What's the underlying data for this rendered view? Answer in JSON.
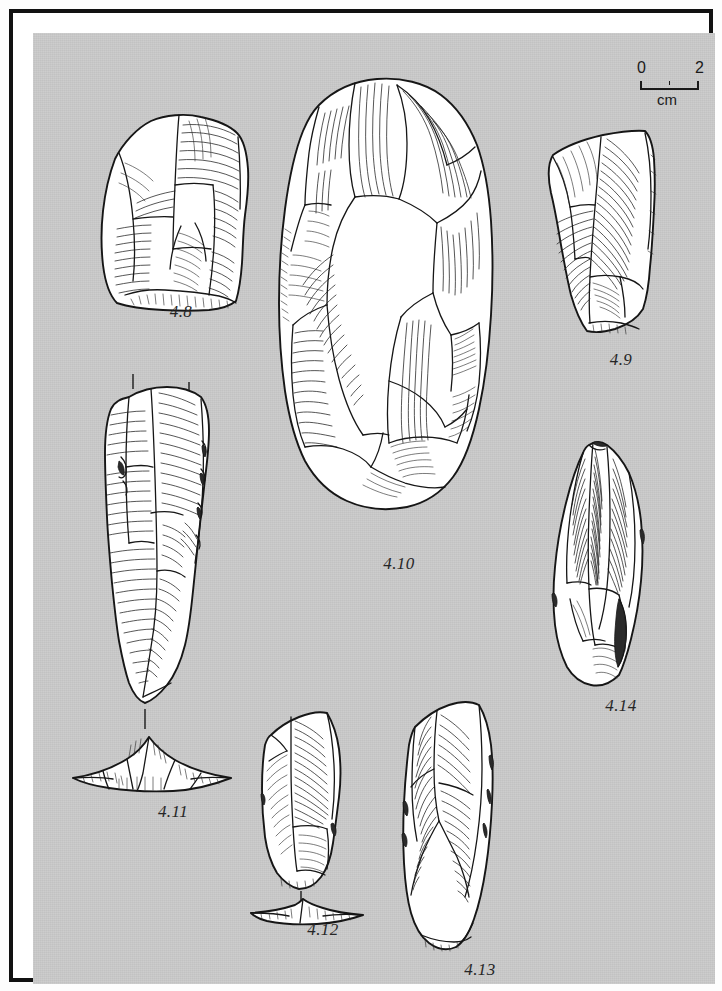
{
  "plate": {
    "title": "Lithic artefact illustration plate",
    "background_color": "#c9c9c9",
    "frame_color": "#111111",
    "ink_color": "#1a1a1a"
  },
  "scale_bar": {
    "name": "scale-bar",
    "start_label": "0",
    "end_label": "2",
    "unit_label": "cm",
    "minor_tick_value": "1"
  },
  "figures": [
    {
      "id": "4.8",
      "label": "4.8",
      "name": "artefact-4-8",
      "type": "flake-scraper",
      "orientation": "dorsal",
      "caption_x": 148,
      "caption_y": 289
    },
    {
      "id": "4.9",
      "label": "4.9",
      "name": "artefact-4-9",
      "type": "side-scraper",
      "orientation": "dorsal",
      "caption_x": 588,
      "caption_y": 337
    },
    {
      "id": "4.10",
      "label": "4.10",
      "name": "artefact-4-10",
      "type": "large-core-biface",
      "orientation": "dorsal",
      "caption_x": 366,
      "caption_y": 541
    },
    {
      "id": "4.11",
      "label": "4.11",
      "name": "artefact-4-11",
      "type": "elongated-blade",
      "orientation": "dorsal-with-section",
      "has_section": true,
      "has_section_ticks": true,
      "caption_x": 140,
      "caption_y": 789
    },
    {
      "id": "4.12",
      "label": "4.12",
      "name": "artefact-4-12",
      "type": "small-blade",
      "orientation": "dorsal-with-section",
      "has_section": true,
      "caption_x": 290,
      "caption_y": 907
    },
    {
      "id": "4.13",
      "label": "4.13",
      "name": "artefact-4-13",
      "type": "blade",
      "orientation": "dorsal",
      "caption_x": 447,
      "caption_y": 947
    },
    {
      "id": "4.14",
      "label": "4.14",
      "name": "artefact-4-14",
      "type": "point",
      "orientation": "dorsal",
      "caption_x": 588,
      "caption_y": 683
    }
  ]
}
